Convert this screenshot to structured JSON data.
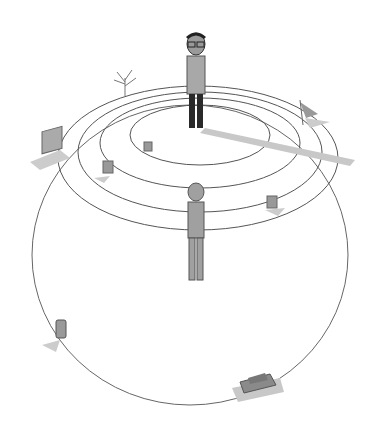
{
  "scene": {
    "description": "Sketch illustration of a small round planet with concentric rings on top; a man in glasses stands at the top center casting a long shadow, a nude figure stands in the middle, small objects (picture frames, tree, flag, car, phone) sit on the planet surface.",
    "colors": {
      "background": "#ffffff",
      "line": "#555555",
      "shadow": "#c8c8c8",
      "figure_gray": "#9a9a9a",
      "dark": "#2a2a2a"
    },
    "objects": [
      "planet",
      "rings",
      "man-with-glasses",
      "nude-figure",
      "bare-tree",
      "flag",
      "picture-frame",
      "small-frames",
      "car",
      "phone"
    ]
  }
}
